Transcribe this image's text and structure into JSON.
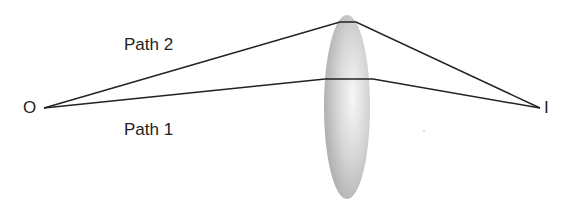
{
  "diagram": {
    "type": "optics-lens-ray-diagram",
    "labels": {
      "object": "O",
      "image": "I",
      "path1": "Path 1",
      "path2": "Path 2"
    },
    "colors": {
      "ray": "#222222",
      "lens_edge": "#9a9a9a",
      "lens_center": "#f2f2f2",
      "text": "#222222"
    }
  }
}
